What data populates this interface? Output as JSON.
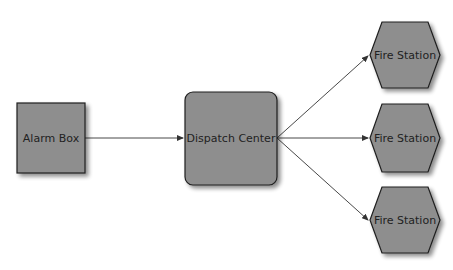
{
  "diagram": {
    "colors": {
      "fill": "#8e8e8e",
      "stroke": "#1e1e1e",
      "edge": "#333333",
      "background": "#ffffff"
    },
    "nodes": [
      {
        "id": "alarm",
        "label": "Alarm Box",
        "shape": "square"
      },
      {
        "id": "dispatch",
        "label": "Dispatch Center",
        "shape": "rounded-rect"
      },
      {
        "id": "fire1",
        "label": "Fire Station",
        "shape": "hexagon"
      },
      {
        "id": "fire2",
        "label": "Fire Station",
        "shape": "hexagon"
      },
      {
        "id": "fire3",
        "label": "Fire Station",
        "shape": "hexagon"
      }
    ],
    "edges": [
      {
        "from": "alarm",
        "to": "dispatch"
      },
      {
        "from": "dispatch",
        "to": "fire1"
      },
      {
        "from": "dispatch",
        "to": "fire2"
      },
      {
        "from": "dispatch",
        "to": "fire3"
      }
    ]
  }
}
